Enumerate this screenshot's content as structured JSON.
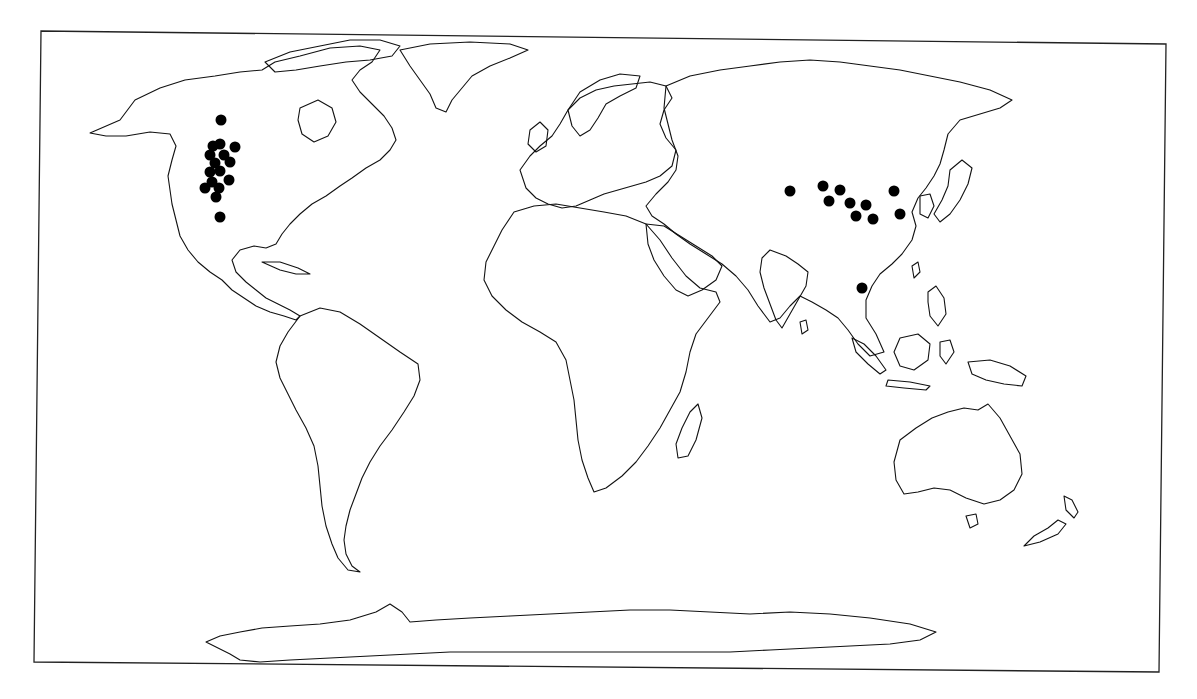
{
  "map": {
    "projection": "world outline, Pacific split at dateline",
    "frame_color": "#222222",
    "coast_color": "#111111",
    "dot_color": "#000000",
    "background": "#ffffff"
  },
  "points": {
    "north_america": [
      {
        "x": 221,
        "y": 120
      },
      {
        "x": 213,
        "y": 146
      },
      {
        "x": 220,
        "y": 144
      },
      {
        "x": 235,
        "y": 147
      },
      {
        "x": 210,
        "y": 155
      },
      {
        "x": 224,
        "y": 155
      },
      {
        "x": 230,
        "y": 162
      },
      {
        "x": 215,
        "y": 163
      },
      {
        "x": 210,
        "y": 172
      },
      {
        "x": 220,
        "y": 171
      },
      {
        "x": 229,
        "y": 180
      },
      {
        "x": 212,
        "y": 182
      },
      {
        "x": 205,
        "y": 188
      },
      {
        "x": 219,
        "y": 188
      },
      {
        "x": 216,
        "y": 197
      },
      {
        "x": 220,
        "y": 217
      }
    ],
    "asia": [
      {
        "x": 790,
        "y": 191
      },
      {
        "x": 823,
        "y": 186
      },
      {
        "x": 840,
        "y": 190
      },
      {
        "x": 829,
        "y": 201
      },
      {
        "x": 850,
        "y": 203
      },
      {
        "x": 866,
        "y": 205
      },
      {
        "x": 856,
        "y": 216
      },
      {
        "x": 873,
        "y": 219
      },
      {
        "x": 894,
        "y": 191
      },
      {
        "x": 900,
        "y": 214
      },
      {
        "x": 862,
        "y": 288
      }
    ]
  }
}
